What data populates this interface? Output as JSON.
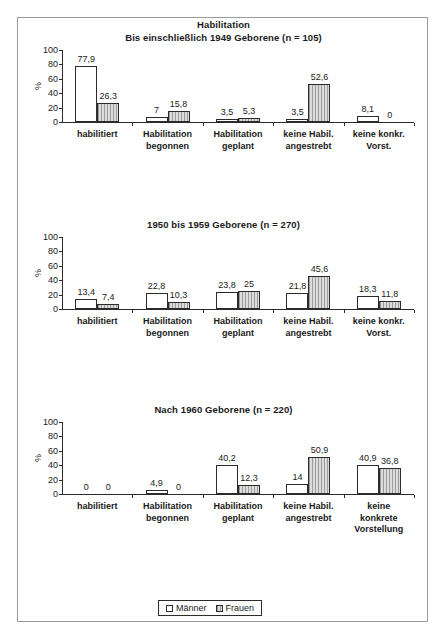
{
  "figure": {
    "main_title": "Habilitation",
    "legend": {
      "items": [
        {
          "label": "Männer",
          "pattern": "white"
        },
        {
          "label": "Frauen",
          "pattern": "hatched-gray"
        }
      ]
    },
    "axis_label": "%",
    "y_ticks": [
      "0",
      "20",
      "40",
      "60",
      "80",
      "100"
    ]
  },
  "chart_data": [
    {
      "type": "bar",
      "title": "Habilitation",
      "subtitle": "Bis einschließlich 1949 Geborene (n = 105)",
      "xlabel": "",
      "ylabel": "%",
      "ylim": [
        0,
        100
      ],
      "yticks": [
        0,
        20,
        40,
        60,
        80,
        100
      ],
      "grid": false,
      "legend_position": "bottom",
      "categories": [
        "habilitiert",
        "Habilitation\nbegonnen",
        "Habilitation\ngeplant",
        "keine Habil.\nangestrebt",
        "keine konkr.\nVorst."
      ],
      "series": [
        {
          "name": "Männer",
          "values": [
            77.9,
            7,
            3.5,
            3.5,
            8.1
          ],
          "labels": [
            "77,9",
            "7",
            "3,5",
            "3,5",
            "8,1"
          ]
        },
        {
          "name": "Frauen",
          "values": [
            26.3,
            15.8,
            5.3,
            52.6,
            0
          ],
          "labels": [
            "26,3",
            "15,8",
            "5,3",
            "52,6",
            "0"
          ]
        }
      ]
    },
    {
      "type": "bar",
      "title": "",
      "subtitle": "1950 bis 1959 Geborene (n = 270)",
      "xlabel": "",
      "ylabel": "%",
      "ylim": [
        0,
        100
      ],
      "yticks": [
        0,
        20,
        40,
        60,
        80,
        100
      ],
      "grid": false,
      "legend_position": "bottom",
      "categories": [
        "habilitiert",
        "Habilitation\nbegonnen",
        "Habilitation\ngeplant",
        "keine Habil.\nangestrebt",
        "keine konkr.\nVorst."
      ],
      "series": [
        {
          "name": "Männer",
          "values": [
            13.4,
            22.8,
            23.8,
            21.8,
            18.3
          ],
          "labels": [
            "13,4",
            "22,8",
            "23,8",
            "21,8",
            "18,3"
          ]
        },
        {
          "name": "Frauen",
          "values": [
            7.4,
            10.3,
            25,
            45.6,
            11.8
          ],
          "labels": [
            "7,4",
            "10,3",
            "25",
            "45,6",
            "11,8"
          ]
        }
      ]
    },
    {
      "type": "bar",
      "title": "",
      "subtitle": "Nach 1960 Geborene (n = 220)",
      "xlabel": "",
      "ylabel": "%",
      "ylim": [
        0,
        100
      ],
      "yticks": [
        0,
        20,
        40,
        60,
        80,
        100
      ],
      "grid": false,
      "legend_position": "bottom",
      "categories": [
        "habilitiert",
        "Habilitation\nbegonnen",
        "Habilitation\ngeplant",
        "keine Habil.\nangestrebt",
        "keine\nkonkrete\nVorstellung"
      ],
      "series": [
        {
          "name": "Männer",
          "values": [
            0,
            4.9,
            40.2,
            14,
            40.9
          ],
          "labels": [
            "0",
            "4,9",
            "40,2",
            "14",
            "40,9"
          ]
        },
        {
          "name": "Frauen",
          "values": [
            0,
            0,
            12.3,
            50.9,
            36.8
          ],
          "labels": [
            "0",
            "0",
            "12,3",
            "50,9",
            "36,8"
          ]
        }
      ]
    }
  ]
}
